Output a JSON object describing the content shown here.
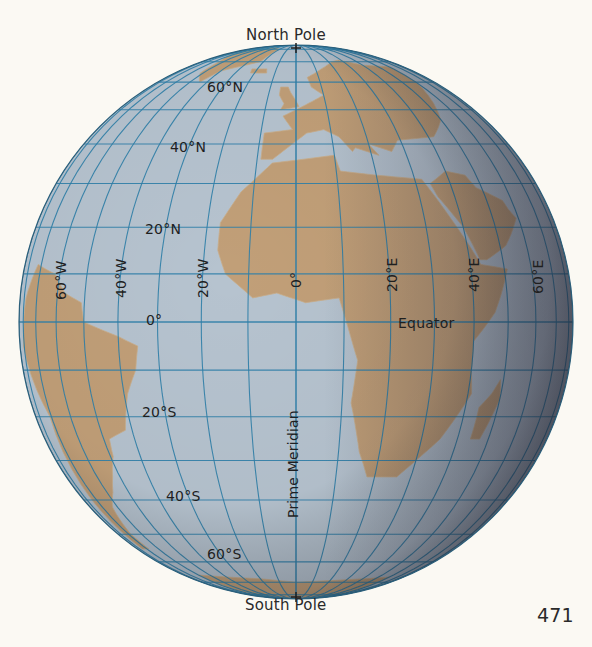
{
  "figure": {
    "page_number": "471",
    "labels": {
      "north_pole": "North Pole",
      "south_pole": "South Pole",
      "equator": "Equator",
      "prime_meridian": "Prime Meridian"
    },
    "latitude_labels": [
      {
        "text": "60°N",
        "lat": 60
      },
      {
        "text": "40°N",
        "lat": 40
      },
      {
        "text": "20°N",
        "lat": 20
      },
      {
        "text": "0°",
        "lat": 0
      },
      {
        "text": "20°S",
        "lat": -20
      },
      {
        "text": "40°S",
        "lat": -40
      },
      {
        "text": "60°S",
        "lat": -60
      }
    ],
    "longitude_labels": [
      {
        "text": "60°W",
        "lon": -60
      },
      {
        "text": "40°W",
        "lon": -40
      },
      {
        "text": "20°W",
        "lon": -20
      },
      {
        "text": "0°",
        "lon": 0
      },
      {
        "text": "20°E",
        "lon": 20
      },
      {
        "text": "40°E",
        "lon": 40
      },
      {
        "text": "60°E",
        "lon": 60
      }
    ],
    "grid": {
      "spacing_deg": 10,
      "projection": "orthographic",
      "center_lat": 0,
      "center_lon": 0
    },
    "colors": {
      "ocean": "#b6c3cf",
      "land": "#c19f78",
      "grid_line": "#2f7fa8",
      "background": "#fbf9f3",
      "text": "#1f1f1f"
    }
  }
}
